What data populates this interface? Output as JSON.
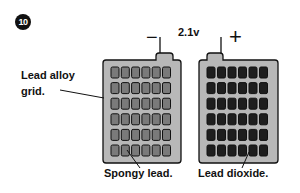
{
  "step": "10",
  "voltage": "2.1v",
  "terminals": {
    "negative": "−",
    "positive": "+"
  },
  "labels": {
    "grid": [
      "Lead alloy",
      "grid."
    ],
    "negative_plate": "Spongy lead.",
    "positive_plate": "Lead dioxide."
  },
  "plates": {
    "negative": {
      "rows": 6,
      "cols": 6,
      "frame_color": "#b8b8b8",
      "cell_color": "#7a7a7a"
    },
    "positive": {
      "rows": 6,
      "cols": 6,
      "frame_color": "#b8b8b8",
      "cell_color": "#1e1e1e"
    }
  }
}
